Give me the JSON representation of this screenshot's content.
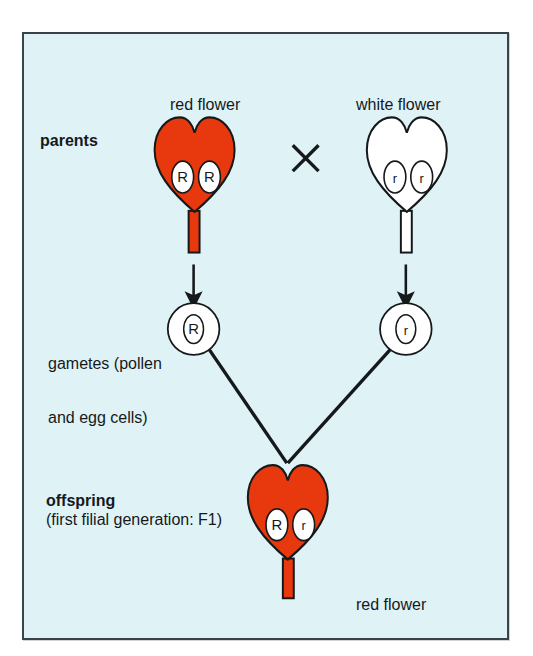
{
  "figure": {
    "type": "genetics-monohybrid-cross-diagram",
    "background_color": "#dff3f7",
    "border_color": "#3a4448",
    "red_color": "#e8380d",
    "white_color": "#ffffff",
    "outline_color": "#16191b"
  },
  "rows": {
    "parents_label": "parents",
    "gametes_label_line1": "gametes (pollen",
    "gametes_label_line2": "and egg cells)",
    "offspring_label": "offspring",
    "offspring_sublabel": "(first filial generation: F1)"
  },
  "parents": {
    "left": {
      "caption": "red flower",
      "phenotype": "red",
      "genotype": "RR",
      "alleles": [
        "R",
        "R"
      ],
      "fill": "#e8380d"
    },
    "cross_symbol": "×",
    "right": {
      "caption": "white flower",
      "phenotype": "white",
      "genotype": "rr",
      "alleles": [
        "r",
        "r"
      ],
      "fill": "#ffffff"
    }
  },
  "gametes": {
    "left": {
      "allele": "R"
    },
    "right": {
      "allele": "r"
    }
  },
  "offspring": {
    "caption": "red flower",
    "phenotype": "red",
    "genotype": "Rr",
    "alleles": [
      "R",
      "r"
    ],
    "fill": "#e8380d"
  }
}
